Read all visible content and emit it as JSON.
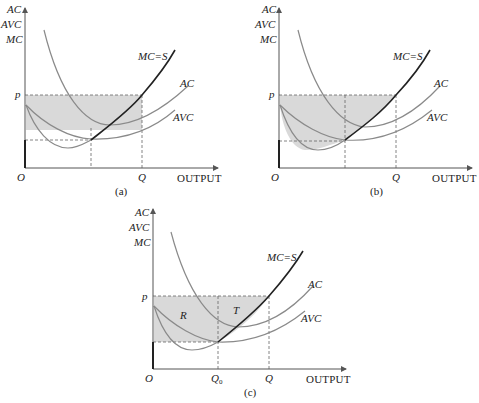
{
  "figure": {
    "panels": [
      {
        "id": "a",
        "caption": "(a)",
        "y_axis_labels": [
          "AC",
          "AVC",
          "MC"
        ],
        "x_axis_label": "OUTPUT",
        "origin_label": "O",
        "price_label": "p",
        "quantity_label": "Q",
        "curve_labels": {
          "mc": "MC=S",
          "ac": "AC",
          "avc": "AVC"
        },
        "shaded_region": "rectangle between p and min AC, from O to Q"
      },
      {
        "id": "b",
        "caption": "(b)",
        "y_axis_labels": [
          "AC",
          "AVC",
          "MC"
        ],
        "x_axis_label": "OUTPUT",
        "origin_label": "O",
        "price_label": "p",
        "quantity_label": "Q",
        "curve_labels": {
          "mc": "MC=S",
          "ac": "AC",
          "avc": "AVC"
        },
        "shaded_region": "area between p and MC curve, from O to Q"
      },
      {
        "id": "c",
        "caption": "(c)",
        "y_axis_labels": [
          "AC",
          "AVC",
          "MC"
        ],
        "x_axis_label": "OUTPUT",
        "origin_label": "O",
        "price_label": "p",
        "quantity_label": "Q",
        "q0_label": "Q",
        "q0_subscript": "0",
        "curve_labels": {
          "mc": "MC=S",
          "ac": "AC",
          "avc": "AVC"
        },
        "region_labels": {
          "r": "R",
          "t": "T"
        },
        "shaded_region": "rectangle R (O to Q0, min AVC to p) plus area T (Q0 to Q, between p and MC)"
      }
    ],
    "colors": {
      "axis": "#555555",
      "mc_curve": "#222222",
      "cost_curves": "#8a8a8a",
      "shade": "#d9d9d9",
      "dashed": "#666666"
    }
  }
}
